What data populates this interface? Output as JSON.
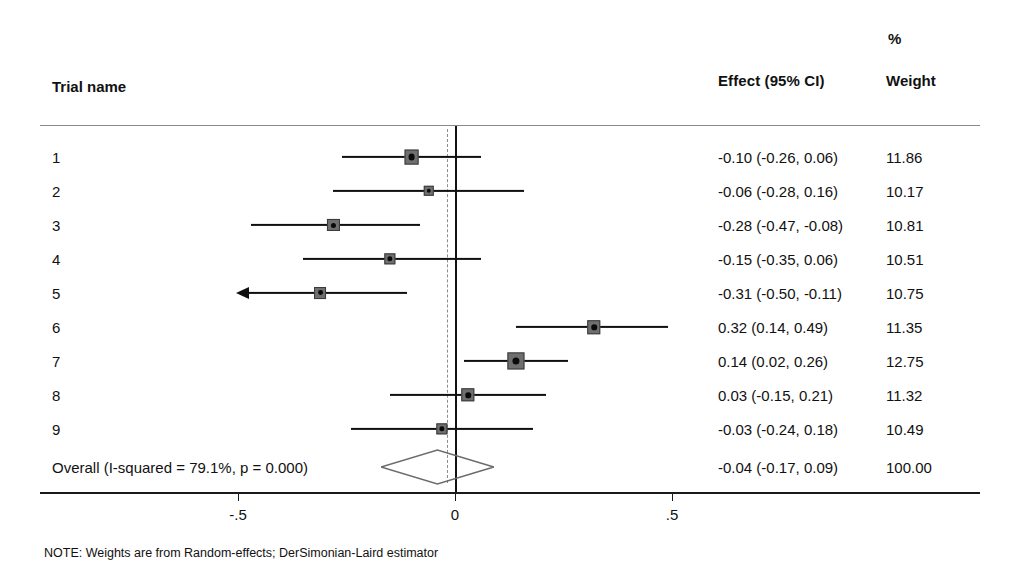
{
  "header": {
    "trial_name_label": "Trial name",
    "effect_label": "Effect (95% CI)",
    "weight_label": "Weight",
    "percent_symbol": "%"
  },
  "footnote": "NOTE: Weights are from Random-effects; DerSimonian-Laird estimator",
  "axis": {
    "ticks": [
      "-.5",
      "0",
      ".5"
    ],
    "tick_values": [
      -0.5,
      0,
      0.5
    ]
  },
  "overall": {
    "label": "Overall (I-squared = 79.1%, p = 0.000)",
    "effect_text": "-0.04 (-0.17, 0.09)",
    "weight_text": "100.00"
  },
  "chart_data": {
    "type": "forest",
    "title": "",
    "xlabel": "",
    "ylabel": "",
    "xlim": [
      -0.62,
      0.62
    ],
    "grid": false,
    "null_line": 0,
    "pooled_line": -0.04,
    "columns": [
      "Trial name",
      "Effect (95% CI)",
      "% Weight"
    ],
    "studies": [
      {
        "name": "1",
        "effect": -0.1,
        "ci_low": -0.26,
        "ci_high": 0.06,
        "weight": 11.86,
        "effect_text": "-0.10 (-0.26, 0.06)",
        "weight_text": "11.86",
        "truncated_left": false
      },
      {
        "name": "2",
        "effect": -0.06,
        "ci_low": -0.28,
        "ci_high": 0.16,
        "weight": 10.17,
        "effect_text": "-0.06 (-0.28, 0.16)",
        "weight_text": "10.17",
        "truncated_left": false
      },
      {
        "name": "3",
        "effect": -0.28,
        "ci_low": -0.47,
        "ci_high": -0.08,
        "weight": 10.81,
        "effect_text": "-0.28 (-0.47, -0.08)",
        "weight_text": "10.81",
        "truncated_left": false
      },
      {
        "name": "4",
        "effect": -0.15,
        "ci_low": -0.35,
        "ci_high": 0.06,
        "weight": 10.51,
        "effect_text": "-0.15 (-0.35, 0.06)",
        "weight_text": "10.51",
        "truncated_left": false
      },
      {
        "name": "5",
        "effect": -0.31,
        "ci_low": -0.5,
        "ci_high": -0.11,
        "weight": 10.75,
        "effect_text": "-0.31 (-0.50, -0.11)",
        "weight_text": "10.75",
        "truncated_left": true
      },
      {
        "name": "6",
        "effect": 0.32,
        "ci_low": 0.14,
        "ci_high": 0.49,
        "weight": 11.35,
        "effect_text": "0.32 (0.14, 0.49)",
        "weight_text": "11.35",
        "truncated_left": false
      },
      {
        "name": "7",
        "effect": 0.14,
        "ci_low": 0.02,
        "ci_high": 0.26,
        "weight": 12.75,
        "effect_text": "0.14 (0.02, 0.26)",
        "weight_text": "12.75",
        "truncated_left": false
      },
      {
        "name": "8",
        "effect": 0.03,
        "ci_low": -0.15,
        "ci_high": 0.21,
        "weight": 11.32,
        "effect_text": "0.03 (-0.15, 0.21)",
        "weight_text": "11.32",
        "truncated_left": false
      },
      {
        "name": "9",
        "effect": -0.03,
        "ci_low": -0.24,
        "ci_high": 0.18,
        "weight": 10.49,
        "effect_text": "-0.03 (-0.24, 0.18)",
        "weight_text": "10.49",
        "truncated_left": false
      }
    ],
    "pooled": {
      "name": "Overall (I-squared = 79.1%, p = 0.000)",
      "effect": -0.04,
      "ci_low": -0.17,
      "ci_high": 0.09,
      "weight": 100.0,
      "effect_text": "-0.04 (-0.17, 0.09)",
      "weight_text": "100.00",
      "i_squared": "79.1%",
      "p_value": "0.000"
    },
    "colors": {
      "line": "#101010",
      "marker_fill": "#6f6f6f",
      "marker_center": "#0a0a0a",
      "null_line": "#121212",
      "pooled_line": "#8c8c8c",
      "diamond_stroke": "#6b6b6b",
      "rule": "#8a8a8a",
      "text": "#111111"
    }
  }
}
